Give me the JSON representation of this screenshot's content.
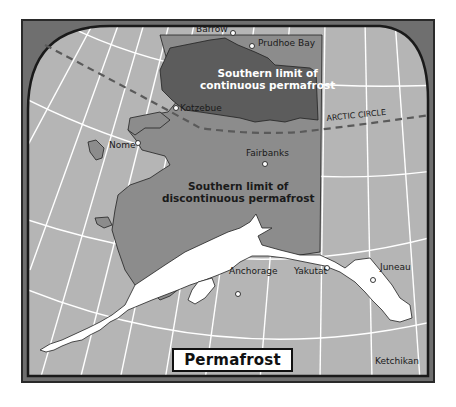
{
  "map": {
    "title": "Permafrost",
    "colors": {
      "frame": "#6f6f6f",
      "ocean": "#b5b5b5",
      "continuous_permafrost": "#5c5c5c",
      "discontinuous_permafrost": "#8c8c8c",
      "no_permafrost": "#ffffff",
      "graticule": "#ffffff",
      "border": "#1a1a1a"
    },
    "regions": {
      "continuous": "Southern limit of continuous permafrost",
      "continuous_line1": "Southern limit of",
      "continuous_line2": "continuous permafrost",
      "discontinuous_line1": "Southern limit of",
      "discontinuous_line2": "discontinuous permafrost"
    },
    "arctic_circle_label": "ARCTIC CIRCLE",
    "places": [
      {
        "name": "Barrow"
      },
      {
        "name": "Prudhoe Bay"
      },
      {
        "name": "Kotzebue"
      },
      {
        "name": "Nome"
      },
      {
        "name": "Fairbanks"
      },
      {
        "name": "Anchorage"
      },
      {
        "name": "Yakutat"
      },
      {
        "name": "Juneau"
      },
      {
        "name": "Ketchikan"
      }
    ]
  }
}
